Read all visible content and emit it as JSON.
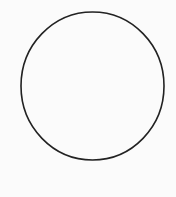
{
  "figure": {
    "shape": "circle",
    "stroke_color": "#222222",
    "fill_color": "none",
    "background_color": "#fbfbfb",
    "center": [
      92.5,
      86
    ],
    "radius_x": 71.5,
    "radius_y": 74,
    "stroke_width": 1.6
  }
}
